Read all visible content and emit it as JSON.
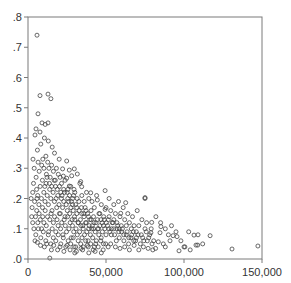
{
  "chart_data": {
    "type": "scatter",
    "title": "",
    "xlabel": "",
    "ylabel": "",
    "xlim": [
      0,
      150000
    ],
    "ylim": [
      0,
      0.8
    ],
    "grid": false,
    "legend": null,
    "marker": "hollow-circle",
    "colors": {
      "marker_stroke": "#444444",
      "frame": "#7a7a7a",
      "text": "#333333",
      "background": "#ffffff"
    },
    "x_ticks": [
      {
        "value": 0,
        "label": "0"
      },
      {
        "value": 50000,
        "label": "50,000"
      },
      {
        "value": 100000,
        "label": "100,000"
      },
      {
        "value": 150000,
        "label": "150,000"
      }
    ],
    "y_ticks": [
      {
        "value": 0.0,
        "label": ".0"
      },
      {
        "value": 0.1,
        "label": ".1"
      },
      {
        "value": 0.2,
        "label": ".2"
      },
      {
        "value": 0.3,
        "label": ".3"
      },
      {
        "value": 0.4,
        "label": ".4"
      },
      {
        "value": 0.5,
        "label": ".5"
      },
      {
        "value": 0.6,
        "label": ".6"
      },
      {
        "value": 0.7,
        "label": ".7"
      },
      {
        "value": 0.8,
        "label": ".8"
      }
    ],
    "points": [
      [
        5800,
        0.74
      ],
      [
        7700,
        0.54
      ],
      [
        12800,
        0.545
      ],
      [
        14700,
        0.53
      ],
      [
        6400,
        0.48
      ],
      [
        9000,
        0.45
      ],
      [
        12800,
        0.45
      ],
      [
        5100,
        0.43
      ],
      [
        7700,
        0.42
      ],
      [
        11000,
        0.445
      ],
      [
        10500,
        0.4
      ],
      [
        13000,
        0.39
      ],
      [
        4500,
        0.41
      ],
      [
        8200,
        0.38
      ],
      [
        15500,
        0.37
      ],
      [
        6000,
        0.36
      ],
      [
        3200,
        0.33
      ],
      [
        17000,
        0.35
      ],
      [
        11500,
        0.34
      ],
      [
        20000,
        0.33
      ],
      [
        24800,
        0.324
      ],
      [
        22200,
        0.298
      ],
      [
        26500,
        0.294
      ],
      [
        29700,
        0.298
      ],
      [
        31600,
        0.281
      ],
      [
        28000,
        0.275
      ],
      [
        22600,
        0.274
      ],
      [
        24800,
        0.267
      ],
      [
        33800,
        0.256
      ],
      [
        34400,
        0.239
      ],
      [
        26500,
        0.241
      ],
      [
        33300,
        0.25
      ],
      [
        40200,
        0.219
      ],
      [
        49400,
        0.226
      ],
      [
        44400,
        0.195
      ],
      [
        62600,
        0.186
      ],
      [
        75000,
        0.203
      ],
      [
        59400,
        0.151
      ],
      [
        49400,
        0.164
      ],
      [
        75000,
        0.2
      ],
      [
        116700,
        0.077
      ],
      [
        106400,
        0.079
      ],
      [
        108800,
        0.046
      ],
      [
        96800,
        0.027
      ],
      [
        100000,
        0.04
      ],
      [
        94900,
        0.09
      ],
      [
        95500,
        0.074
      ],
      [
        93000,
        0.077
      ],
      [
        85200,
        0.107
      ],
      [
        79300,
        0.121
      ],
      [
        84600,
        0.087
      ],
      [
        83500,
        0.057
      ],
      [
        86700,
        0.05
      ],
      [
        81800,
        0.035
      ],
      [
        78800,
        0.087
      ],
      [
        130800,
        0.033
      ],
      [
        147400,
        0.043
      ],
      [
        109000,
        0.08
      ],
      [
        107700,
        0.046
      ],
      [
        100600,
        0.04
      ],
      [
        14000,
        0.003
      ],
      [
        30000,
        0.02
      ],
      [
        2000,
        0.2
      ],
      [
        3500,
        0.25
      ],
      [
        4000,
        0.3
      ],
      [
        5200,
        0.27
      ],
      [
        2600,
        0.17
      ],
      [
        6500,
        0.32
      ],
      [
        7200,
        0.29
      ],
      [
        8800,
        0.31
      ],
      [
        9500,
        0.33
      ],
      [
        10200,
        0.3
      ],
      [
        11800,
        0.28
      ],
      [
        12600,
        0.32
      ],
      [
        13400,
        0.3
      ],
      [
        14200,
        0.27
      ],
      [
        15100,
        0.31
      ],
      [
        16300,
        0.29
      ],
      [
        17500,
        0.26
      ],
      [
        18200,
        0.3
      ],
      [
        19400,
        0.28
      ],
      [
        20600,
        0.27
      ],
      [
        21500,
        0.25
      ],
      [
        22900,
        0.23
      ],
      [
        23800,
        0.26
      ],
      [
        25100,
        0.22
      ],
      [
        26600,
        0.21
      ],
      [
        27400,
        0.24
      ],
      [
        28600,
        0.2
      ],
      [
        29500,
        0.23
      ],
      [
        3000,
        0.22
      ],
      [
        4200,
        0.19
      ],
      [
        5500,
        0.23
      ],
      [
        6200,
        0.21
      ],
      [
        7000,
        0.18
      ],
      [
        7800,
        0.24
      ],
      [
        8600,
        0.2
      ],
      [
        9300,
        0.17
      ],
      [
        10100,
        0.22
      ],
      [
        10900,
        0.19
      ],
      [
        11600,
        0.25
      ],
      [
        12300,
        0.21
      ],
      [
        13100,
        0.18
      ],
      [
        13900,
        0.23
      ],
      [
        14600,
        0.2
      ],
      [
        15400,
        0.16
      ],
      [
        16100,
        0.22
      ],
      [
        16900,
        0.19
      ],
      [
        17600,
        0.24
      ],
      [
        18400,
        0.17
      ],
      [
        19100,
        0.21
      ],
      [
        19900,
        0.18
      ],
      [
        20700,
        0.15
      ],
      [
        21400,
        0.2
      ],
      [
        22200,
        0.17
      ],
      [
        22900,
        0.19
      ],
      [
        23700,
        0.14
      ],
      [
        24500,
        0.18
      ],
      [
        25200,
        0.16
      ],
      [
        26000,
        0.19
      ],
      [
        26700,
        0.15
      ],
      [
        27500,
        0.17
      ],
      [
        28300,
        0.13
      ],
      [
        29000,
        0.16
      ],
      [
        29800,
        0.14
      ],
      [
        30600,
        0.18
      ],
      [
        31300,
        0.15
      ],
      [
        32100,
        0.12
      ],
      [
        32800,
        0.16
      ],
      [
        33600,
        0.13
      ],
      [
        34400,
        0.15
      ],
      [
        35100,
        0.11
      ],
      [
        35900,
        0.14
      ],
      [
        36600,
        0.17
      ],
      [
        37400,
        0.12
      ],
      [
        38200,
        0.15
      ],
      [
        38900,
        0.1
      ],
      [
        39700,
        0.13
      ],
      [
        40400,
        0.16
      ],
      [
        41200,
        0.11
      ],
      [
        4800,
        0.14
      ],
      [
        5600,
        0.16
      ],
      [
        6300,
        0.12
      ],
      [
        7100,
        0.15
      ],
      [
        7900,
        0.13
      ],
      [
        8700,
        0.1
      ],
      [
        9400,
        0.14
      ],
      [
        10200,
        0.12
      ],
      [
        11000,
        0.16
      ],
      [
        11700,
        0.11
      ],
      [
        12500,
        0.14
      ],
      [
        13200,
        0.09
      ],
      [
        14000,
        0.13
      ],
      [
        14800,
        0.15
      ],
      [
        15500,
        0.1
      ],
      [
        16300,
        0.12
      ],
      [
        17000,
        0.14
      ],
      [
        17800,
        0.09
      ],
      [
        18600,
        0.13
      ],
      [
        19300,
        0.11
      ],
      [
        20100,
        0.15
      ],
      [
        20900,
        0.1
      ],
      [
        21600,
        0.12
      ],
      [
        22400,
        0.08
      ],
      [
        23200,
        0.13
      ],
      [
        23900,
        0.11
      ],
      [
        24700,
        0.09
      ],
      [
        25400,
        0.14
      ],
      [
        26200,
        0.1
      ],
      [
        27000,
        0.12
      ],
      [
        27700,
        0.07
      ],
      [
        28500,
        0.11
      ],
      [
        29300,
        0.09
      ],
      [
        30000,
        0.13
      ],
      [
        30800,
        0.1
      ],
      [
        31600,
        0.08
      ],
      [
        32300,
        0.12
      ],
      [
        33100,
        0.09
      ],
      [
        33900,
        0.11
      ],
      [
        34600,
        0.07
      ],
      [
        35400,
        0.1
      ],
      [
        36200,
        0.08
      ],
      [
        36900,
        0.12
      ],
      [
        37700,
        0.09
      ],
      [
        38500,
        0.06
      ],
      [
        39200,
        0.11
      ],
      [
        40000,
        0.08
      ],
      [
        40800,
        0.1
      ],
      [
        41500,
        0.07
      ],
      [
        42300,
        0.12
      ],
      [
        43100,
        0.09
      ],
      [
        43800,
        0.06
      ],
      [
        44600,
        0.1
      ],
      [
        45400,
        0.08
      ],
      [
        46100,
        0.11
      ],
      [
        46900,
        0.07
      ],
      [
        47700,
        0.09
      ],
      [
        48400,
        0.05
      ],
      [
        49200,
        0.1
      ],
      [
        50000,
        0.08
      ],
      [
        5000,
        0.08
      ],
      [
        6600,
        0.1
      ],
      [
        8200,
        0.07
      ],
      [
        9800,
        0.09
      ],
      [
        11400,
        0.06
      ],
      [
        13000,
        0.08
      ],
      [
        14600,
        0.05
      ],
      [
        16200,
        0.07
      ],
      [
        17800,
        0.06
      ],
      [
        19400,
        0.08
      ],
      [
        21000,
        0.05
      ],
      [
        22600,
        0.07
      ],
      [
        24200,
        0.04
      ],
      [
        25800,
        0.06
      ],
      [
        27400,
        0.05
      ],
      [
        29000,
        0.07
      ],
      [
        30600,
        0.04
      ],
      [
        32200,
        0.06
      ],
      [
        33800,
        0.05
      ],
      [
        35400,
        0.04
      ],
      [
        37000,
        0.06
      ],
      [
        38600,
        0.04
      ],
      [
        40200,
        0.05
      ],
      [
        41800,
        0.03
      ],
      [
        43400,
        0.05
      ],
      [
        45000,
        0.04
      ],
      [
        46600,
        0.06
      ],
      [
        48200,
        0.03
      ],
      [
        49800,
        0.05
      ],
      [
        51400,
        0.04
      ],
      [
        10500,
        0.04
      ],
      [
        15000,
        0.03
      ],
      [
        19000,
        0.03
      ],
      [
        23000,
        0.025
      ],
      [
        27000,
        0.03
      ],
      [
        31000,
        0.025
      ],
      [
        35000,
        0.03
      ],
      [
        39000,
        0.02
      ],
      [
        43000,
        0.025
      ],
      [
        47000,
        0.02
      ],
      [
        41000,
        0.19
      ],
      [
        42500,
        0.17
      ],
      [
        44000,
        0.21
      ],
      [
        45500,
        0.15
      ],
      [
        47000,
        0.18
      ],
      [
        48500,
        0.14
      ],
      [
        50000,
        0.17
      ],
      [
        51500,
        0.13
      ],
      [
        53000,
        0.16
      ],
      [
        54500,
        0.12
      ],
      [
        56000,
        0.15
      ],
      [
        57500,
        0.11
      ],
      [
        59000,
        0.14
      ],
      [
        60500,
        0.1
      ],
      [
        62000,
        0.13
      ],
      [
        63500,
        0.09
      ],
      [
        65000,
        0.12
      ],
      [
        66500,
        0.08
      ],
      [
        68000,
        0.11
      ],
      [
        69500,
        0.07
      ],
      [
        51000,
        0.11
      ],
      [
        52500,
        0.09
      ],
      [
        54000,
        0.12
      ],
      [
        55500,
        0.08
      ],
      [
        57000,
        0.1
      ],
      [
        58500,
        0.07
      ],
      [
        60000,
        0.09
      ],
      [
        61500,
        0.06
      ],
      [
        63000,
        0.08
      ],
      [
        64500,
        0.05
      ],
      [
        66000,
        0.07
      ],
      [
        67500,
        0.09
      ],
      [
        69000,
        0.06
      ],
      [
        70500,
        0.08
      ],
      [
        72000,
        0.05
      ],
      [
        73500,
        0.07
      ],
      [
        75000,
        0.1
      ],
      [
        76500,
        0.06
      ],
      [
        78000,
        0.08
      ],
      [
        79500,
        0.05
      ],
      [
        53000,
        0.05
      ],
      [
        56000,
        0.04
      ],
      [
        59000,
        0.035
      ],
      [
        62000,
        0.04
      ],
      [
        65000,
        0.03
      ],
      [
        68000,
        0.045
      ],
      [
        71000,
        0.03
      ],
      [
        74000,
        0.04
      ],
      [
        77000,
        0.035
      ],
      [
        80000,
        0.03
      ],
      [
        52000,
        0.2
      ],
      [
        55000,
        0.18
      ],
      [
        58000,
        0.19
      ],
      [
        61000,
        0.17
      ],
      [
        64000,
        0.15
      ],
      [
        67000,
        0.14
      ],
      [
        70000,
        0.16
      ],
      [
        73000,
        0.13
      ],
      [
        76000,
        0.12
      ],
      [
        82000,
        0.14
      ],
      [
        85000,
        0.12
      ],
      [
        88000,
        0.1
      ],
      [
        90000,
        0.08
      ],
      [
        92000,
        0.11
      ],
      [
        98000,
        0.06
      ],
      [
        103000,
        0.09
      ],
      [
        112000,
        0.05
      ],
      [
        88000,
        0.04
      ],
      [
        91000,
        0.06
      ],
      [
        104000,
        0.03
      ],
      [
        37500,
        0.22
      ],
      [
        39000,
        0.2
      ],
      [
        36000,
        0.19
      ],
      [
        34500,
        0.21
      ],
      [
        31500,
        0.2
      ],
      [
        30000,
        0.22
      ],
      [
        28500,
        0.18
      ],
      [
        25500,
        0.2
      ],
      [
        21000,
        0.22
      ],
      [
        18000,
        0.2
      ],
      [
        42000,
        0.14
      ],
      [
        44500,
        0.13
      ],
      [
        46000,
        0.15
      ],
      [
        47500,
        0.12
      ],
      [
        49000,
        0.13
      ],
      [
        52000,
        0.14
      ],
      [
        53500,
        0.1
      ],
      [
        55000,
        0.13
      ],
      [
        57000,
        0.12
      ],
      [
        58500,
        0.1
      ],
      [
        6000,
        0.055
      ],
      [
        8000,
        0.045
      ],
      [
        12000,
        0.05
      ],
      [
        16500,
        0.045
      ],
      [
        20500,
        0.04
      ],
      [
        25000,
        0.045
      ],
      [
        29500,
        0.04
      ],
      [
        34000,
        0.035
      ],
      [
        38000,
        0.045
      ],
      [
        42500,
        0.04
      ],
      [
        3000,
        0.12
      ],
      [
        3800,
        0.1
      ],
      [
        4500,
        0.06
      ],
      [
        2400,
        0.14
      ],
      [
        5800,
        0.2
      ],
      [
        9200,
        0.26
      ],
      [
        10800,
        0.24
      ],
      [
        12200,
        0.27
      ],
      [
        13800,
        0.25
      ],
      [
        15200,
        0.24
      ],
      [
        16800,
        0.26
      ],
      [
        18800,
        0.23
      ],
      [
        20200,
        0.24
      ],
      [
        21800,
        0.21
      ],
      [
        23400,
        0.22
      ],
      [
        25600,
        0.23
      ],
      [
        27800,
        0.19
      ],
      [
        29200,
        0.21
      ],
      [
        31200,
        0.17
      ],
      [
        32600,
        0.19
      ],
      [
        34200,
        0.17
      ],
      [
        35800,
        0.15
      ],
      [
        37200,
        0.16
      ],
      [
        38800,
        0.14
      ],
      [
        40600,
        0.13
      ],
      [
        42000,
        0.1
      ],
      [
        43600,
        0.12
      ],
      [
        45200,
        0.1
      ],
      [
        46800,
        0.13
      ],
      [
        48400,
        0.11
      ],
      [
        50200,
        0.12
      ],
      [
        51800,
        0.1
      ],
      [
        53400,
        0.08
      ],
      [
        55000,
        0.1
      ],
      [
        56600,
        0.06
      ],
      [
        58200,
        0.09
      ],
      [
        59800,
        0.11
      ],
      [
        61400,
        0.08
      ],
      [
        63000,
        0.11
      ],
      [
        64600,
        0.07
      ],
      [
        66200,
        0.1
      ],
      [
        67800,
        0.06
      ],
      [
        69400,
        0.09
      ],
      [
        71000,
        0.11
      ],
      [
        72600,
        0.08
      ],
      [
        74200,
        0.06
      ],
      [
        75800,
        0.09
      ],
      [
        77400,
        0.07
      ],
      [
        79000,
        0.1
      ],
      [
        80600,
        0.06
      ]
    ]
  }
}
